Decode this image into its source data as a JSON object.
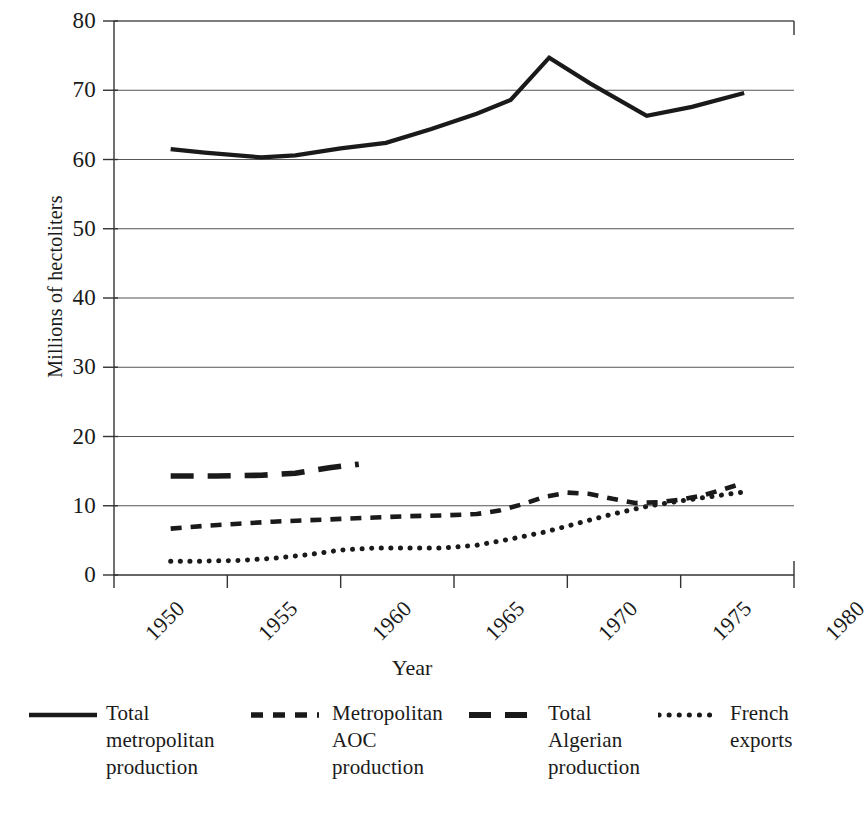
{
  "chart_data": {
    "type": "line",
    "title": "",
    "xlabel": "Year",
    "ylabel": "Millions of hectoliters",
    "xlim": [
      1950,
      1980
    ],
    "ylim": [
      0,
      80
    ],
    "grid": true,
    "legend_position": "bottom",
    "x_ticks": [
      "1950",
      "1955",
      "1960",
      "1965",
      "1970",
      "1975",
      "1980"
    ],
    "y_ticks": [
      "0",
      "10",
      "20",
      "30",
      "40",
      "50",
      "60",
      "70",
      "80"
    ],
    "series": [
      {
        "name": "Total metropolitan production",
        "style": "solid",
        "x": [
          1952.5,
          1954.0,
          1956.5,
          1958.0,
          1960.0,
          1962.0,
          1964.0,
          1966.0,
          1967.5,
          1969.2,
          1971.0,
          1973.5,
          1975.5,
          1977.8
        ],
        "values": [
          61.5,
          61.0,
          60.3,
          60.6,
          61.6,
          62.4,
          64.4,
          66.6,
          68.6,
          74.7,
          71.0,
          66.3,
          67.6,
          69.6
        ]
      },
      {
        "name": "Metropolitan AOC production",
        "style": "dashed-short",
        "x": [
          1952.5,
          1954.0,
          1955.5,
          1957.0,
          1958.5,
          1960.0,
          1961.5,
          1963.0,
          1964.5,
          1966.0,
          1967.0,
          1968.0,
          1969.0,
          1970.0,
          1971.0,
          1972.0,
          1973.0,
          1974.0,
          1975.0,
          1976.0,
          1977.0,
          1977.8
        ],
        "values": [
          6.7,
          7.1,
          7.4,
          7.7,
          7.9,
          8.1,
          8.3,
          8.5,
          8.6,
          8.8,
          9.3,
          10.2,
          11.3,
          11.9,
          11.7,
          11.0,
          10.4,
          10.5,
          10.9,
          11.5,
          12.5,
          13.3
        ]
      },
      {
        "name": "Total Algerian production",
        "style": "dashed-long",
        "x": [
          1952.5,
          1954.5,
          1956.5,
          1958.0,
          1959.5,
          1960.8
        ],
        "values": [
          14.3,
          14.3,
          14.4,
          14.7,
          15.5,
          16.0
        ]
      },
      {
        "name": "French exports",
        "style": "dotted",
        "x": [
          1952.5,
          1954.0,
          1955.5,
          1957.0,
          1958.5,
          1960.0,
          1961.5,
          1963.0,
          1964.5,
          1966.0,
          1967.5,
          1969.0,
          1970.5,
          1972.0,
          1973.5,
          1975.0,
          1976.5,
          1977.8
        ],
        "values": [
          2.0,
          2.0,
          2.1,
          2.4,
          2.9,
          3.6,
          3.9,
          3.9,
          3.9,
          4.3,
          5.2,
          6.2,
          7.5,
          8.8,
          9.9,
          10.7,
          11.4,
          12.0
        ]
      }
    ]
  },
  "axes": {
    "y_title": "Millions of hectoliters",
    "x_title": "Year",
    "y_tick_labels": [
      "80",
      "70",
      "60",
      "50",
      "40",
      "30",
      "20",
      "10",
      "0"
    ],
    "x_tick_labels": [
      "1950",
      "1955",
      "1960",
      "1965",
      "1970",
      "1975",
      "1980"
    ]
  },
  "legend": {
    "items": [
      {
        "label": "Total metropolitan production",
        "style": "solid"
      },
      {
        "label": "Metropolitan AOC production",
        "style": "dashed-short"
      },
      {
        "label": "Total Algerian production",
        "style": "dashed-long"
      },
      {
        "label": "French exports",
        "style": "dotted"
      }
    ]
  },
  "colors": {
    "ink": "#1a1a1a",
    "gridline": "#555555",
    "axis": "#333333",
    "background": "#ffffff"
  }
}
